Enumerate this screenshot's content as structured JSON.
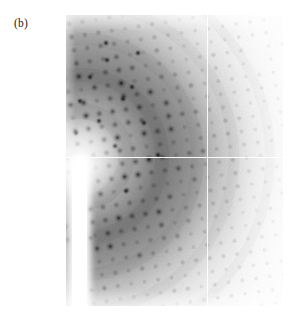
{
  "figure": {
    "panel_label": "(b)",
    "caption_text": "",
    "background_color": "#ffffff"
  },
  "detector_image": {
    "name": "x-ray-diffraction-pattern",
    "description": "Single-crystal X-ray diffraction still image with concentric diffuse rings and a lattice of Bragg spots",
    "frame": {
      "x": 66,
      "y": 15,
      "width": 217,
      "height": 291
    },
    "background_color": "#f2f2f2",
    "beam_center": {
      "x": 14,
      "y": 142
    },
    "fiducial_lines": {
      "horizontal_y": 142,
      "vertical_x": 141,
      "color": "#ffffff"
    },
    "beamstop": {
      "name": "beamstop-shadow",
      "x": 6,
      "y": 145,
      "width": 15,
      "height": 146,
      "color": "#ffffff"
    },
    "rings": [
      {
        "radius": 42,
        "intensity": 0.1,
        "width": 26
      },
      {
        "radius": 78,
        "intensity": 0.26,
        "width": 30
      },
      {
        "radius": 112,
        "intensity": 0.2,
        "width": 30
      },
      {
        "radius": 150,
        "intensity": 0.11,
        "width": 34
      },
      {
        "radius": 190,
        "intensity": 0.05,
        "width": 34
      }
    ],
    "lattice": {
      "origin": {
        "x": 14,
        "y": 142
      },
      "a_vector": {
        "x": 13.2,
        "y": -2.1
      },
      "b_vector": {
        "x": 2.4,
        "y": 13.0
      },
      "h_range": [
        -2,
        20
      ],
      "k_range": [
        -13,
        13
      ],
      "max_spot_radius": 2.7,
      "spot_color": "#101010"
    },
    "intensity_falloff": {
      "type": "radial",
      "max_radius": 215,
      "note": "spot darkness decreases with distance from beam center"
    }
  },
  "chart_data": {
    "type": "heatmap",
    "title": "",
    "xlabel": "",
    "ylabel": "",
    "legend": [],
    "annotations": [
      "(b)"
    ]
  }
}
